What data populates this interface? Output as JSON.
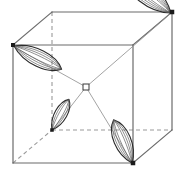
{
  "figure": {
    "type": "line-diagram",
    "width": 185,
    "height": 180,
    "background": "#ffffff"
  },
  "style": {
    "solid_edge_color": "#6b6b6b",
    "hidden_edge_color": "#9a9a9a",
    "bond_color": "#8c8c8c",
    "lobe_outline_color": "#2b2b2b",
    "lobe_inner_color": "#555555",
    "vertex_color": "#1a1a1a",
    "center_marker_color": "#3a3a3a",
    "solid_edge_width": 1.2,
    "hidden_edge_width": 1.1,
    "bond_width": 0.8,
    "lobe_outline_width": 1.1,
    "lobe_inner_width": 0.6,
    "hidden_dash": "4,3"
  },
  "cube": {
    "label": "unit cell cube",
    "vertices": {
      "front_top_left": [
        13,
        45
      ],
      "front_top_right": [
        133,
        45
      ],
      "front_bottom_left": [
        13,
        163
      ],
      "front_bottom_right": [
        133,
        163
      ],
      "back_top_left": [
        52,
        12
      ],
      "back_top_right": [
        172,
        12
      ],
      "back_bottom_left": [
        52,
        130
      ],
      "back_bottom_right": [
        172,
        130
      ]
    },
    "solid_edges": [
      [
        "front_top_left",
        "front_top_right"
      ],
      [
        "front_top_right",
        "front_bottom_right"
      ],
      [
        "front_bottom_right",
        "front_bottom_left"
      ],
      [
        "front_bottom_left",
        "front_top_left"
      ],
      [
        "back_top_left",
        "back_top_right"
      ],
      [
        "back_top_right",
        "back_bottom_right"
      ],
      [
        "front_top_left",
        "back_top_left"
      ],
      [
        "front_top_right",
        "back_top_right"
      ],
      [
        "front_bottom_right",
        "back_bottom_right"
      ]
    ],
    "hidden_edges": [
      [
        "back_top_left",
        "back_bottom_left"
      ],
      [
        "back_bottom_left",
        "back_bottom_right"
      ],
      [
        "front_bottom_left",
        "back_bottom_left"
      ]
    ]
  },
  "center": {
    "label": "central site marker",
    "position": [
      86,
      87
    ],
    "marker": "open-square",
    "size": 6
  },
  "bonds": {
    "label": "bonds from centre to lobe vertices",
    "lines": [
      {
        "name": "bond-to-front-top-left",
        "from": [
          86,
          87
        ],
        "to": [
          16,
          48
        ]
      },
      {
        "name": "bond-to-back-top-right",
        "from": [
          86,
          87
        ],
        "to": [
          169,
          15
        ]
      },
      {
        "name": "bond-to-back-bottom-left",
        "from": [
          86,
          87
        ],
        "to": [
          54,
          128
        ]
      },
      {
        "name": "bond-to-front-bottom-right",
        "from": [
          86,
          87
        ],
        "to": [
          131,
          161
        ]
      }
    ]
  },
  "lobes": [
    {
      "name": "lobe-front-top-left",
      "at_vertex": "front_top_left",
      "apex": [
        14,
        46
      ],
      "tip": [
        62,
        69
      ],
      "length": 53,
      "width": 22,
      "rotation_deg": 26,
      "inner_strokes": 3
    },
    {
      "name": "lobe-back-top-right",
      "at_vertex": "back_top_right",
      "apex": [
        171,
        13
      ],
      "tip": [
        124,
        50
      ],
      "length": 60,
      "width": 26,
      "rotation_deg": 218,
      "inner_strokes": 4
    },
    {
      "name": "lobe-back-bottom-left",
      "at_vertex": "back_bottom_left",
      "apex": [
        52,
        130
      ],
      "tip": [
        69,
        100
      ],
      "length": 35,
      "width": 16,
      "rotation_deg": -61,
      "inner_strokes": 2
    },
    {
      "name": "lobe-front-bottom-right",
      "at_vertex": "front_bottom_right",
      "apex": [
        132,
        163
      ],
      "tip": [
        114,
        120
      ],
      "length": 47,
      "width": 22,
      "rotation_deg": -113,
      "inner_strokes": 3
    }
  ],
  "vertex_dots": [
    {
      "name": "vertex-dot-front-top-left",
      "position": [
        13,
        45
      ],
      "size": 4
    },
    {
      "name": "vertex-dot-back-top-right",
      "position": [
        172,
        12
      ],
      "size": 4.5
    },
    {
      "name": "vertex-dot-back-bottom-left",
      "position": [
        52,
        130
      ],
      "size": 3.5
    },
    {
      "name": "vertex-dot-front-bottom-right",
      "position": [
        133,
        163
      ],
      "size": 4.5
    }
  ]
}
